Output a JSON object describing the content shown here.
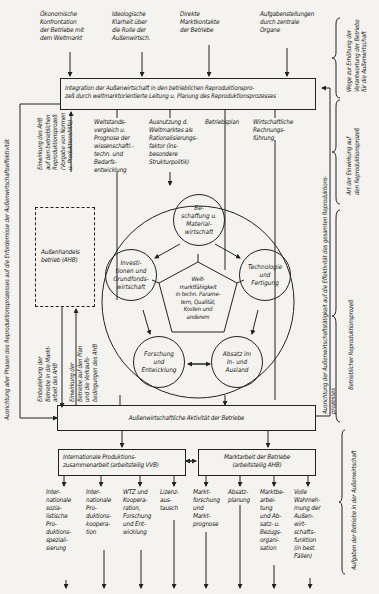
{
  "top_inputs": [
    "Ökonomische\nKonfrontation\nder Betriebe mit\ndem Weltmarkt",
    "Ideologische\nKlarheit über\ndie Rolle der\nAußenwirtsch.",
    "Direkte\nMarktkontakte\nder Betriebe",
    "Aufgabenstellungen\ndurch zentrale\nOrgane"
  ],
  "integration_box": "Integration der Außenwirtschaft in den betrieblichen Reproduktionspro-\nzeß durch weltmarktorientierte Leitung u. Planung des Reproduktionsprozesses",
  "planning_items": [
    "Weltstands-\nvergleich u.\nPrognose der\nwissenschaftl.-\ntechn. und\nBedarfs-\nentwicklung",
    "Ausnutzung d.\nWeltmarktes als\nRationalisierungs-\nfaktor (ins-\nbesondere\nStrukturpolitik)",
    "Betriebsplan",
    "Wirtschaftliche\nRechnungs-\nführung"
  ],
  "ahb": {
    "box_label": "Außenhandels\nbetrieb (AHB)",
    "upper_label": "Einwirkung des AHB\nauf den betrieblichen\nReproduktionsprozeß\n(Vorgabe von Normen\nu. Produktionshilfe)",
    "lower_left_label": "Einbeziehung der\nBetriebe in die Markt-\narbeit des AHB",
    "lower_right_label": "Einwirkung der\nBetriebe auf den Plan\nund die Verkaufs-\nbedingungen des AHB"
  },
  "circle": {
    "center": "Welt-\nmarktfähigkeit\nin techn. Parame-\ntern, Qualität,\nKosten und\nanderem",
    "nodes": [
      "Be-\nschaffung u.\nMaterial-\nwirtschaft",
      "Technologie\nund\nFertigung",
      "Absatz im\nIn- und\nAusland",
      "Forschung\nund\nEntwicklung",
      "Investi-\ntionen und\nGrundfonds-\nwirtschaft"
    ]
  },
  "activity_box": "Außenwirtschaftliche Aktivität der Betriebe",
  "sub_boxes": {
    "left": "Internationale Produktions-\nzusammenarbeit (arbeitsteilig VVB)",
    "right": "Marktarbeit der Betriebe\n(arbeitsteilig AHB)"
  },
  "bottom_items": [
    "Inter-\nnationale\nsozia-\nlistische\nPro-\nduktions-\nspeziali-\nsierung",
    "Inter-\nnationale\nPro-\nduktions-\nkoopera-\ntion",
    "WTZ und\nKoopera-\nration,\nForschung\nund Ent-\nwicklung",
    "Lizenz-\naus-\ntausch",
    "Markt-\nforschung\nund\nMarkt-\nprognose",
    "Absatz-\nplanung",
    "Marktbe-\narbei-\ntung\nund Ab-\nsatz- u.\nBezugs-\norgani-\nsation",
    "Volle\nWahrneh-\nmung der\nAußen-\nwirt-\nschafts-\nfunktion\n(in best.\nFällen)"
  ],
  "side_labels": {
    "left_outer": "Ausrichtung aller Phasen des Reproduktionsprozesses auf die Erfordernisse der Außenwirtschaftseffektivität",
    "right_inner": "Ausrichtung der Außenwirtschaftstätigkeit auf die Effektivität des gesamten Reproduktions-\nprozesses",
    "brace_1": "Wege zur Erhöhung der\nVerantwortung der Betriebe\nfür die Außenwirtschaft",
    "brace_2": "Art der Einwirkung auf\nden Reproduktionsprozeß",
    "brace_3": "Betrieblicher Reproduktionsprozeß",
    "brace_4": "Aufgaben der Betriebe in der Außenwirtschaft"
  }
}
